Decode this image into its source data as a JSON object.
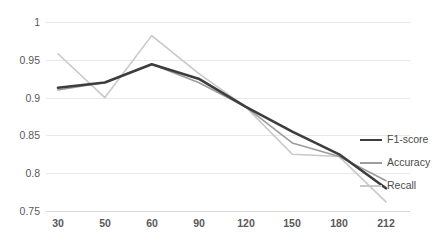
{
  "chart_data": {
    "type": "line",
    "title": "",
    "xlabel": "",
    "ylabel": "",
    "categories": [
      "30",
      "50",
      "60",
      "90",
      "120",
      "150",
      "180",
      "212"
    ],
    "x": [
      30,
      50,
      60,
      90,
      120,
      150,
      180,
      212
    ],
    "ylim": [
      0.75,
      1.0
    ],
    "yticks": [
      "1",
      "0.95",
      "0.9",
      "0.85",
      "0.8",
      "0.75"
    ],
    "ytick_values": [
      1.0,
      0.95,
      0.9,
      0.85,
      0.8,
      0.75
    ],
    "grid": true,
    "legend_position": "right",
    "series": [
      {
        "name": "F1-score",
        "color": "#3d3d3d",
        "width": 2.6,
        "values": [
          0.913,
          0.92,
          0.944,
          0.925,
          0.888,
          0.855,
          0.825,
          0.78
        ]
      },
      {
        "name": "Accuracy",
        "color": "#9d9d9d",
        "width": 1.6,
        "values": [
          0.91,
          0.92,
          0.944,
          0.92,
          0.888,
          0.84,
          0.822,
          0.79
        ]
      },
      {
        "name": "Recall",
        "color": "#c9c9c9",
        "width": 1.6,
        "values": [
          0.958,
          0.9,
          0.982,
          0.932,
          0.888,
          0.825,
          0.822,
          0.762
        ]
      }
    ]
  },
  "legend": {
    "items": [
      {
        "label": "F1-score"
      },
      {
        "label": "Accuracy"
      },
      {
        "label": "Recall"
      }
    ]
  },
  "axes": {
    "y_labels": [
      "1",
      "0.95",
      "0.9",
      "0.85",
      "0.8",
      "0.75"
    ],
    "x_labels": [
      "30",
      "50",
      "60",
      "90",
      "120",
      "150",
      "180",
      "212"
    ]
  }
}
